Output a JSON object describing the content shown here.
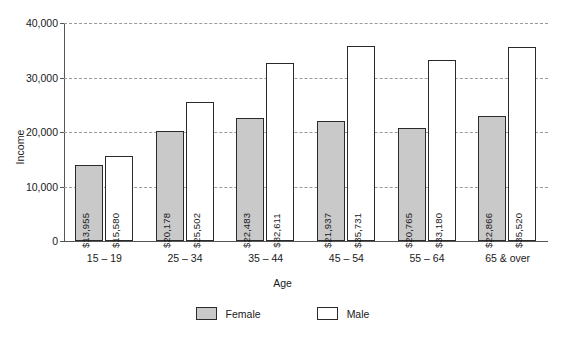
{
  "chart_data": {
    "type": "bar",
    "title": "",
    "xlabel": "Age",
    "ylabel": "Income",
    "categories": [
      "15 – 19",
      "25 – 34",
      "35 – 44",
      "45 – 54",
      "55 – 64",
      "65 & over"
    ],
    "series": [
      {
        "name": "Female",
        "color": "#c9c9c9",
        "values": [
          13955,
          20178,
          22483,
          21937,
          20765,
          22866
        ],
        "labels": [
          "$13,955",
          "$20,178",
          "$22,483",
          "$21,937",
          "$20,765",
          "$22,866"
        ]
      },
      {
        "name": "Male",
        "color": "#ffffff",
        "values": [
          15580,
          25502,
          32611,
          35731,
          33180,
          35520
        ],
        "labels": [
          "$15,580",
          "$25,502",
          "$32,611",
          "$35,731",
          "$33,180",
          "$35,520"
        ]
      }
    ],
    "ylim": [
      0,
      40000
    ],
    "yticks": [
      0,
      10000,
      20000,
      30000,
      40000
    ],
    "ytick_labels": [
      "0",
      "10,000",
      "20,000",
      "30,000",
      "40,000"
    ],
    "grid": true,
    "grid_style": "dashed",
    "legend_position": "bottom"
  },
  "legend": {
    "items": [
      {
        "label": "Female",
        "color": "#c9c9c9"
      },
      {
        "label": "Male",
        "color": "#ffffff"
      }
    ]
  },
  "colors": {
    "female_fill": "#c9c9c9",
    "male_fill": "#ffffff",
    "bar_outline": "#2b2b2b",
    "gridline": "#9a9a9a",
    "axis": "#555555",
    "text": "#1a1a1a",
    "background": "#ffffff"
  }
}
